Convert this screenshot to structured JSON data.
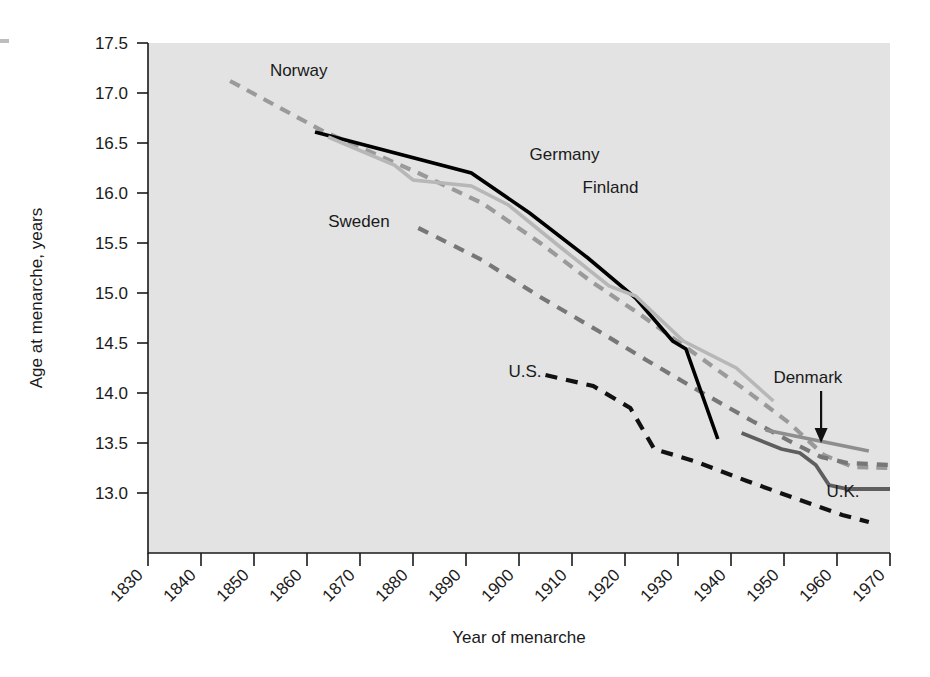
{
  "chart_data": {
    "type": "line",
    "title": "",
    "xlabel": "Year of menarche",
    "ylabel": "Age at menarche, years",
    "xlim": [
      1830,
      1970
    ],
    "ylim": [
      12.6,
      17.5
    ],
    "grid": false,
    "legend": "inline-labels",
    "xticks": [
      "1830",
      "1840",
      "1850",
      "1860",
      "1870",
      "1880",
      "1890",
      "1900",
      "1910",
      "1920",
      "1930",
      "1940",
      "1950",
      "1960",
      "1970"
    ],
    "yticks": [
      "13.0",
      "13.5",
      "14.0",
      "14.5",
      "15.0",
      "15.5",
      "16.0",
      "16.5",
      "17.0",
      "17.5"
    ],
    "series": [
      {
        "name": "Norway",
        "style": "dashed",
        "color": "#9a9a9a",
        "width": 4.2,
        "dash": "11,8",
        "label_x": 1853,
        "label_y": 17.17,
        "points": [
          [
            1845.5,
            17.12
          ],
          [
            1863.0,
            16.62
          ],
          [
            1881.0,
            16.2
          ],
          [
            1893.0,
            15.9
          ],
          [
            1904.0,
            15.5
          ],
          [
            1913.5,
            15.12
          ],
          [
            1923.0,
            14.78
          ],
          [
            1933.0,
            14.4
          ],
          [
            1943.0,
            14.02
          ],
          [
            1951.0,
            13.7
          ],
          [
            1957.5,
            13.38
          ],
          [
            1963.0,
            13.26
          ],
          [
            1970.0,
            13.25
          ]
        ]
      },
      {
        "name": "Sweden",
        "style": "dashed",
        "color": "#777777",
        "width": 4.2,
        "dash": "11,9",
        "label_x": 1864,
        "label_y": 15.66,
        "points": [
          [
            1881.0,
            15.65
          ],
          [
            1893.0,
            15.33
          ],
          [
            1904.0,
            14.96
          ],
          [
            1915.0,
            14.62
          ],
          [
            1924.0,
            14.33
          ],
          [
            1934.0,
            14.02
          ],
          [
            1944.0,
            13.72
          ],
          [
            1951.0,
            13.52
          ],
          [
            1957.0,
            13.36
          ],
          [
            1962.0,
            13.3
          ],
          [
            1970.0,
            13.28
          ]
        ]
      },
      {
        "name": "Germany",
        "style": "solid",
        "color": "#000000",
        "width": 3.6,
        "dash": "",
        "label_x": 1902,
        "label_y": 16.33,
        "points": [
          [
            1861.5,
            16.61
          ],
          [
            1891.0,
            16.2
          ],
          [
            1902.0,
            15.8
          ],
          [
            1913.0,
            15.35
          ],
          [
            1922.0,
            14.95
          ],
          [
            1929.0,
            14.52
          ],
          [
            1931.5,
            14.44
          ],
          [
            1937.5,
            13.54
          ]
        ]
      },
      {
        "name": "Finland",
        "style": "solid",
        "color": "#b7b7b7",
        "width": 3.6,
        "dash": "",
        "label_x": 1912,
        "label_y": 16.0,
        "points": [
          [
            1864.0,
            16.56
          ],
          [
            1876.5,
            16.28
          ],
          [
            1880.0,
            16.13
          ],
          [
            1891.0,
            16.07
          ],
          [
            1898.0,
            15.88
          ],
          [
            1908.0,
            15.45
          ],
          [
            1917.0,
            15.07
          ],
          [
            1922.0,
            14.97
          ],
          [
            1931.0,
            14.52
          ],
          [
            1941.0,
            14.25
          ],
          [
            1948.0,
            13.92
          ]
        ]
      },
      {
        "name": "U.S.",
        "style": "dashed",
        "color": "#111111",
        "width": 4.2,
        "dash": "12,9",
        "label_x": 1898,
        "label_y": 14.16,
        "points": [
          [
            1905.0,
            14.18
          ],
          [
            1914.0,
            14.07
          ],
          [
            1921.0,
            13.85
          ],
          [
            1925.5,
            13.44
          ],
          [
            1933.0,
            13.32
          ],
          [
            1943.0,
            13.12
          ],
          [
            1953.0,
            12.93
          ],
          [
            1961.0,
            12.78
          ],
          [
            1966.0,
            12.71
          ]
        ]
      },
      {
        "name": "Denmark",
        "style": "solid",
        "color": "#8e8e8e",
        "width": 3.8,
        "dash": "",
        "label_x": 1948,
        "label_y": 14.1,
        "points": [
          [
            1946.5,
            13.63
          ],
          [
            1966.0,
            13.42
          ]
        ]
      },
      {
        "name": "U.K.",
        "style": "solid",
        "color": "#5e5e5e",
        "width": 3.8,
        "dash": "",
        "label_x": 1958,
        "label_y": 12.96,
        "points": [
          [
            1942.0,
            13.6
          ],
          [
            1949.5,
            13.44
          ],
          [
            1953.0,
            13.4
          ],
          [
            1956.0,
            13.28
          ],
          [
            1958.5,
            13.08
          ],
          [
            1962.0,
            13.04
          ],
          [
            1970.0,
            13.04
          ]
        ]
      }
    ],
    "annotations": [
      {
        "name": "denmark-arrow",
        "type": "arrow",
        "from_x": 1957.0,
        "from_y": 14.02,
        "to_x": 1957.0,
        "to_y": 13.5
      }
    ]
  }
}
